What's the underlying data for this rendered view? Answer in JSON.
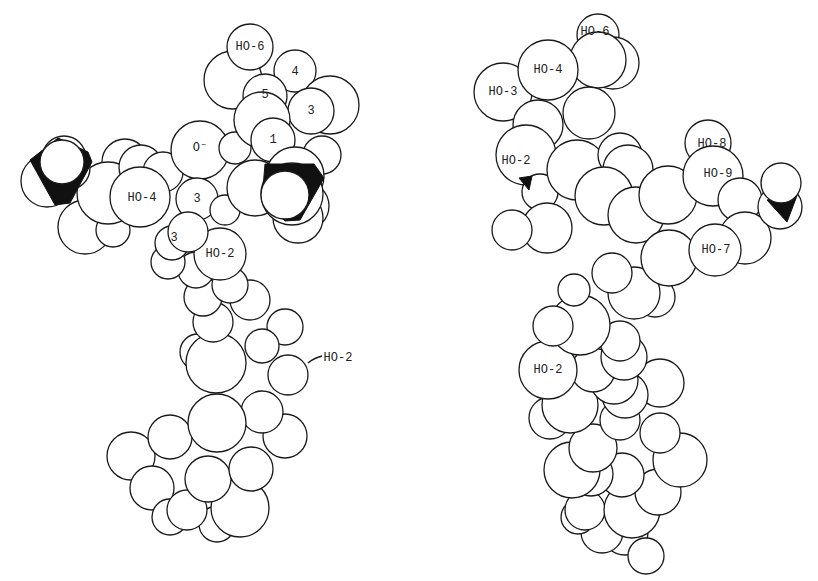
{
  "figure": {
    "panels": [
      {
        "name": "left-model",
        "labels": [
          {
            "text": "HO-6",
            "x": 250,
            "y": 47
          },
          {
            "text": "4",
            "x": 295,
            "y": 72
          },
          {
            "text": "5",
            "x": 265,
            "y": 95
          },
          {
            "text": "3",
            "x": 311,
            "y": 111
          },
          {
            "text": "1",
            "x": 273,
            "y": 140
          },
          {
            "text": "O⁻",
            "x": 200,
            "y": 148
          },
          {
            "text": "HO-4",
            "x": 142,
            "y": 198
          },
          {
            "text": "3",
            "x": 197,
            "y": 199
          },
          {
            "text": "3",
            "x": 174,
            "y": 238
          },
          {
            "text": "HO-2",
            "x": 220,
            "y": 254
          },
          {
            "text": "HO-2",
            "x": 338,
            "y": 358
          }
        ]
      },
      {
        "name": "right-model",
        "labels": [
          {
            "text": "HO-6",
            "x": 595,
            "y": 32
          },
          {
            "text": "HO-4",
            "x": 548,
            "y": 70
          },
          {
            "text": "HO-3",
            "x": 503,
            "y": 92
          },
          {
            "text": "HO-2",
            "x": 516,
            "y": 161
          },
          {
            "text": "HO-8",
            "x": 712,
            "y": 144
          },
          {
            "text": "HO-9",
            "x": 718,
            "y": 174
          },
          {
            "text": "HO-7",
            "x": 716,
            "y": 250
          },
          {
            "text": "HO-2",
            "x": 548,
            "y": 370
          }
        ]
      }
    ]
  }
}
